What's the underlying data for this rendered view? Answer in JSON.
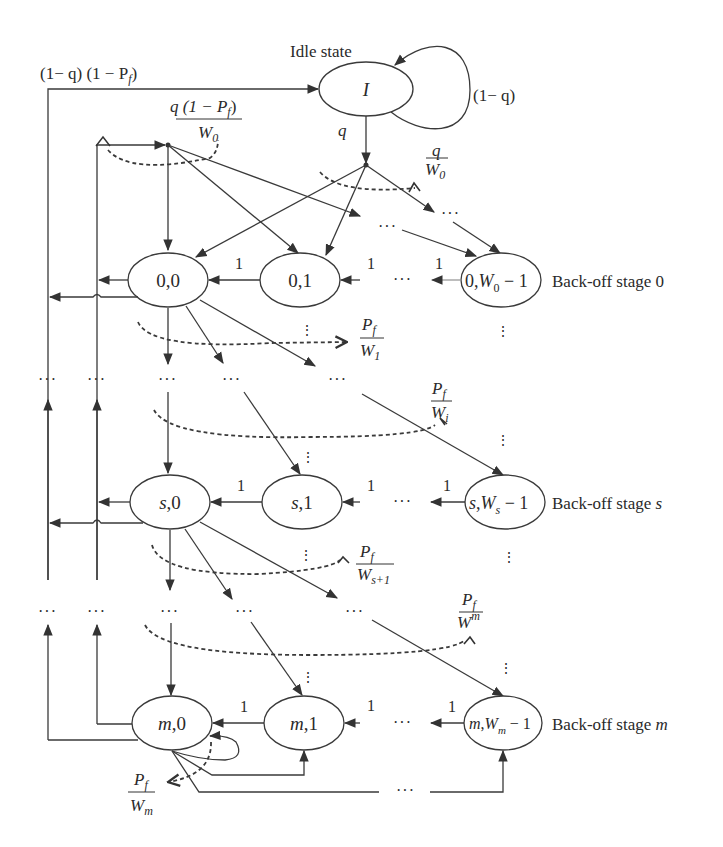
{
  "diagram": {
    "idle_state": {
      "caption": "Idle state",
      "label": "I",
      "self_loop_label": "(1− q)",
      "out_label": "q"
    },
    "top_return_label": "(1− q) (1 − P",
    "top_return_sub": "f",
    "top_return_close": ")",
    "entry_fraction_top": {
      "num": "q (1 − P",
      "num_sub": "f",
      "num_close": ")",
      "den": "W",
      "den_sub": "0"
    },
    "idle_fraction": {
      "num": "q",
      "den": "W",
      "den_sub": "0"
    },
    "stages": [
      {
        "name": "Back-off stage 0",
        "caption": "Back-off stage 0",
        "nodes": [
          {
            "prefix": "0,0",
            "id": "0,0"
          },
          {
            "prefix": "0,1",
            "id": "0,1"
          },
          {
            "prefix": "0,",
            "w": "W",
            "w_sub": "0",
            "suffix": " − 1",
            "id": "0,W0-1"
          }
        ],
        "transition_label": "1"
      },
      {
        "name": "Back-off stage s",
        "caption_text": "Back-off stage ",
        "caption_var": "s",
        "nodes": [
          {
            "var": "s",
            "suffix": ",0",
            "id": "s,0"
          },
          {
            "var": "s",
            "suffix": ",1",
            "id": "s,1"
          },
          {
            "var": "s",
            "mid": ",",
            "w": "W",
            "w_sub": "s",
            "suffix": " − 1",
            "id": "s,Ws-1"
          }
        ],
        "transition_label": "1"
      },
      {
        "name": "Back-off stage m",
        "caption_text": "Back-off stage ",
        "caption_var": "m",
        "nodes": [
          {
            "var": "m",
            "suffix": ",0",
            "id": "m,0"
          },
          {
            "var": "m",
            "suffix": ",1",
            "id": "m,1"
          },
          {
            "var": "m",
            "mid": ",",
            "w": "W",
            "w_sub": "m",
            "suffix": " − 1",
            "id": "m,Wm-1"
          }
        ],
        "transition_label": "1"
      }
    ],
    "failure_fractions": [
      {
        "num": "P",
        "num_sub": "f",
        "den": "W",
        "den_sub": "1"
      },
      {
        "num": "P",
        "num_sub": "f",
        "den": "W",
        "den_sub": "i"
      },
      {
        "num": "P",
        "num_sub": "f",
        "den": "W",
        "den_sub": "s+1"
      },
      {
        "num": "P",
        "num_sub": "f",
        "den": "W",
        "den_sub": "m"
      },
      {
        "num": "P",
        "num_sub": "f",
        "den": "W",
        "den_sub": "m"
      }
    ],
    "ellipsis": "···",
    "vertical_ellipsis": "⋮"
  }
}
